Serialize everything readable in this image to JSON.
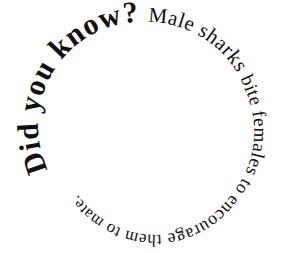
{
  "graphic": {
    "type": "spiral-text",
    "direction": "clockwise-inward",
    "text_color": "#111111",
    "background_color": "#ffffff",
    "segments": [
      {
        "id": "did-you-know",
        "text": "Did you know? ",
        "style": "bold-large"
      },
      {
        "id": "male-sharks",
        "text": "Male sharks ",
        "style": "regular"
      },
      {
        "id": "bite-females",
        "text": "bite females ",
        "style": "regular"
      },
      {
        "id": "to-encourage",
        "text": "to encourage ",
        "style": "regular"
      },
      {
        "id": "them-to",
        "text": "them to ",
        "style": "regular"
      },
      {
        "id": "mate",
        "text": "mate.",
        "style": "regular"
      }
    ],
    "full_text": "Did you know? Male sharks bite females to encourage them to mate."
  }
}
